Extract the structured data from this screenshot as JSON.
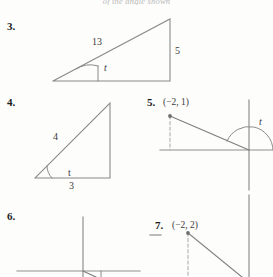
{
  "header": {
    "text": "of the angle shown"
  },
  "problems": [
    {
      "number": "3.",
      "type": "right-triangle",
      "angle_label": "t",
      "side_labels": {
        "hypotenuse": "13",
        "vertical": "5"
      }
    },
    {
      "number": "4.",
      "type": "right-triangle",
      "angle_label": "t",
      "side_labels": {
        "hypotenuse": "4",
        "base": "3"
      }
    },
    {
      "number": "5.",
      "type": "coordinate-axes",
      "point_label": "(−2, 1)",
      "angle_label": "t"
    },
    {
      "number": "6.",
      "type": "coordinate-axes",
      "point_label": "",
      "angle_label": ""
    },
    {
      "number": "7.",
      "type": "coordinate-axes",
      "point_label": "(−2, 2)",
      "angle_label": ""
    }
  ],
  "colors": {
    "ink": "#2b2b2b",
    "stroke": "#8a8a8a",
    "paper": "#fdfdfc"
  }
}
